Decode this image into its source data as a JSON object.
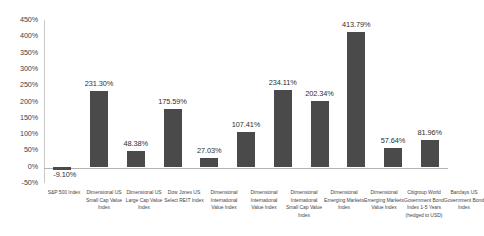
{
  "chart_data": {
    "type": "bar",
    "title": "",
    "subtitle": "",
    "xlabel": "",
    "ylabel": "",
    "ylim": [
      -50,
      450
    ],
    "y_tick_step": 50,
    "grid": false,
    "legend": "none",
    "bar_color": "#4a4a4a",
    "axis_color": "#b4b4b4",
    "categories": [
      "S&P 500 Index",
      "Dimensional US Small Cap Value Index",
      "Dimensional US Large Cap Value Index",
      "Dow Jones US Select REIT Index",
      "Dimensional International Value Index",
      "Dimensional International Value Index",
      "Dimensional International Small Cap Value Index",
      "Dimensional Emerging Markets Index",
      "Dimensional Emerging Markets Value Index",
      "Citigroup World Government Bond Index 1-5 Years (hedged to USD)",
      "Barclays US Government Bond Index"
    ],
    "values": [
      -9.1,
      231.3,
      48.38,
      175.59,
      27.03,
      107.41,
      234.11,
      202.34,
      413.79,
      57.64,
      81.96
    ],
    "value_labels": [
      "-9.10%",
      "231.30%",
      "48.38%",
      "175.59%",
      "27.03%",
      "107.41%",
      "234.11%",
      "202.34%",
      "413.79%",
      "57.64%",
      "81.96%"
    ],
    "y_tick_labels": [
      "450%",
      "400%",
      "350%",
      "300%",
      "250%",
      "200%",
      "150%",
      "100%",
      "50%",
      "0%",
      "-50%"
    ],
    "y_tick_values": [
      450,
      400,
      350,
      300,
      250,
      200,
      150,
      100,
      50,
      0,
      -50
    ]
  }
}
